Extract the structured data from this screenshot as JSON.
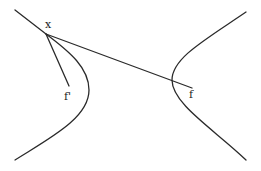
{
  "diagram": {
    "type": "hyperbola-focal-property",
    "labels": {
      "point": "x",
      "focus_left": "f'",
      "focus_right": "f"
    },
    "elements": [
      {
        "name": "left-branch",
        "kind": "curve"
      },
      {
        "name": "right-branch",
        "kind": "curve"
      },
      {
        "name": "segment-x-to-f-prime",
        "kind": "line"
      },
      {
        "name": "segment-x-to-f",
        "kind": "line"
      }
    ],
    "colors": {
      "stroke": "#2a2a2a",
      "background": "#ffffff"
    }
  }
}
